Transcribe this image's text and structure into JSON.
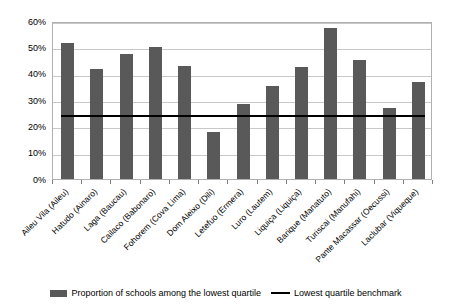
{
  "chart_data": {
    "type": "bar",
    "title": "",
    "xlabel": "",
    "ylabel": "",
    "ylim": [
      0,
      60
    ],
    "ytick_labels": [
      "0%",
      "10%",
      "20%",
      "30%",
      "40%",
      "50%",
      "60%"
    ],
    "ytick_values": [
      0,
      10,
      20,
      30,
      40,
      50,
      60
    ],
    "grid": true,
    "legend_position": "bottom",
    "categories": [
      "Aileu Vila (Aileu)",
      "Hatudo (Ainaro)",
      "Laga (Baucau)",
      "Cailaco (Babonaro)",
      "Fohorem (Cova Lima)",
      "Dom Aleixo (Dili)",
      "Letefuo (Ermera)",
      "Luro (Lautem)",
      "Liquiça (Liquiça)",
      "Barique (Manatuto)",
      "Turiscai (Manufahi)",
      "Pante Macassar (Oecussi)",
      "Laclubar (Viqueque)"
    ],
    "series": [
      {
        "name": "Proportion of schools among the lowest quartile",
        "type": "bar",
        "color": "#595959",
        "values": [
          51.8,
          41.7,
          47.5,
          50.1,
          42.8,
          18.0,
          28.5,
          35.5,
          42.6,
          57.3,
          45.3,
          27.0,
          37.0
        ]
      },
      {
        "name": "Lowest quartile benchmark",
        "type": "line",
        "color": "#000000",
        "value": 25.0
      }
    ],
    "legend": [
      "Proportion of schools among the lowest quartile",
      "Lowest quartile benchmark"
    ]
  }
}
